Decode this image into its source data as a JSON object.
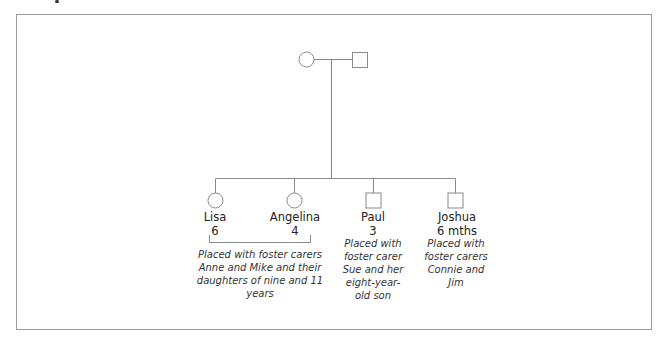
{
  "diagram": {
    "type": "genogram",
    "parents": [
      {
        "shape": "circle",
        "role": "mother"
      },
      {
        "shape": "square",
        "role": "father"
      }
    ],
    "children": [
      {
        "name": "Lisa",
        "age": "6",
        "shape": "circle"
      },
      {
        "name": "Angelina",
        "age": "4",
        "shape": "circle"
      },
      {
        "name": "Paul",
        "age": "3",
        "shape": "square"
      },
      {
        "name": "Joshua",
        "age": "6 mths",
        "shape": "square"
      }
    ],
    "placements": [
      {
        "for": "Lisa and Angelina",
        "lines": [
          "Placed with foster carers",
          "Anne and Mike and their",
          "daughters of nine and 11",
          "years"
        ]
      },
      {
        "for": "Paul",
        "lines": [
          "Placed with",
          "foster carer",
          "Sue and her",
          "eight-year-",
          "old son"
        ]
      },
      {
        "for": "Joshua",
        "lines": [
          "Placed with",
          "foster carers",
          "Connie and",
          "Jim"
        ]
      }
    ],
    "colors": {
      "line": "#8a8a8a",
      "frame": "#9a9a9a",
      "text": "#222222"
    }
  }
}
